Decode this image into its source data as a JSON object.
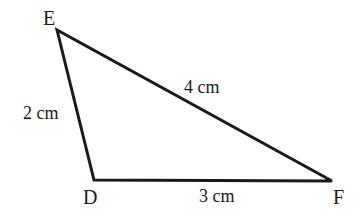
{
  "figure": {
    "type": "triangle-diagram",
    "background_color": "#ffffff",
    "stroke_color": "#1a1a1a",
    "stroke_width": 3,
    "fill": "none",
    "unit": "cm",
    "vertices": [
      {
        "name": "E",
        "label": "E",
        "x": 57,
        "y": 30
      },
      {
        "name": "D",
        "label": "D",
        "x": 94,
        "y": 180
      },
      {
        "name": "F",
        "label": "F",
        "x": 332,
        "y": 181
      }
    ],
    "sides": [
      {
        "name": "ED",
        "from": "E",
        "to": "D",
        "label": "2 cm",
        "length": 2
      },
      {
        "name": "EF",
        "from": "E",
        "to": "F",
        "label": "4 cm",
        "length": 4
      },
      {
        "name": "DF",
        "from": "D",
        "to": "F",
        "label": "3 cm",
        "length": 3
      }
    ]
  },
  "chart_data": {
    "type": "diagram",
    "title": "",
    "shape": "triangle",
    "categories": [
      "ED",
      "EF",
      "DF"
    ],
    "values": [
      2,
      4,
      3
    ],
    "point_labels": [
      "E",
      "D",
      "F"
    ],
    "points": [
      [
        57,
        30
      ],
      [
        94,
        180
      ],
      [
        332,
        181
      ]
    ],
    "annotations": [
      "2 cm",
      "4 cm",
      "3 cm"
    ],
    "units": "cm",
    "grid": false,
    "legend": "none"
  }
}
